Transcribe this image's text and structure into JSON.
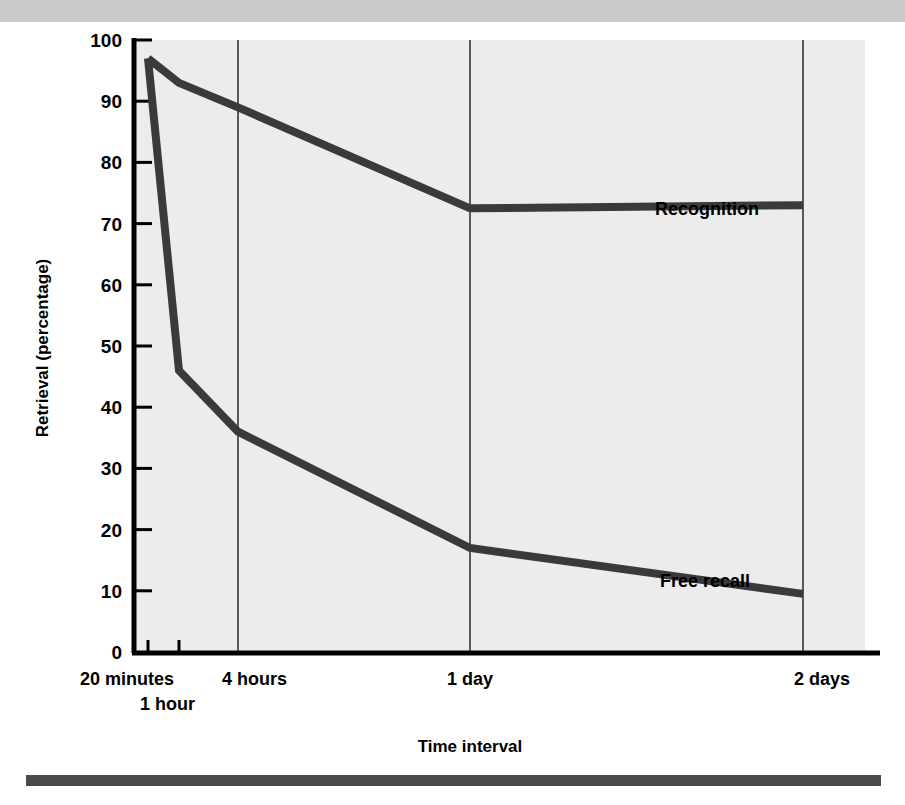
{
  "figure": {
    "background_color": "#ffffff",
    "plot_background_color": "#ececec",
    "top_band_color": "#c9c9c9",
    "bottom_rule_color": "#4a4a4a",
    "line_color": "#3a3a3a",
    "axis_color": "#000000",
    "gridline_color": "#5a5a5a"
  },
  "chart_data": {
    "type": "line",
    "title": "",
    "xlabel": "Time interval",
    "ylabel": "Retrieval (percentage)",
    "categories": [
      "20 minutes",
      "1 hour",
      "4 hours",
      "1 day",
      "2 days"
    ],
    "x": [
      0,
      1,
      2,
      3,
      4
    ],
    "ylim": [
      0,
      100
    ],
    "yticks": [
      0,
      10,
      20,
      30,
      40,
      50,
      60,
      70,
      80,
      90,
      100
    ],
    "ytick_labels": [
      "0",
      "10",
      "20",
      "30",
      "40",
      "50",
      "60",
      "70",
      "80",
      "90",
      "100"
    ],
    "grid": "vertical-only",
    "legend": "inline-labels",
    "series": [
      {
        "name": "Recognition",
        "values": [
          97,
          93,
          89,
          72.5,
          73
        ],
        "label_position": "above-right"
      },
      {
        "name": "Free recall",
        "values": [
          97,
          46,
          36,
          17,
          9.5
        ],
        "label_position": "above-right"
      }
    ]
  },
  "axes": {
    "y_title": "Retrieval (percentage)",
    "x_title": "Time interval",
    "x_labels": {
      "row1": [
        "20 minutes",
        "4 hours",
        "1 day",
        "2 days"
      ],
      "row2": [
        "1 hour"
      ]
    }
  },
  "labels": {
    "recognition": "Recognition",
    "free_recall": "Free recall"
  }
}
